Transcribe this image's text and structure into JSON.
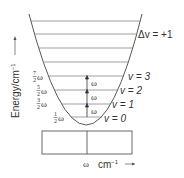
{
  "diagram": {
    "y_axis_label": "Energy/cm",
    "y_axis_exp": "−1",
    "selection_rule": "Δv = +1",
    "levels": [
      {
        "label": "v = 0",
        "energy_num": "1",
        "energy_den": "2",
        "energy_sym": "ω"
      },
      {
        "label": "v = 1",
        "energy_num": "3",
        "energy_den": "2",
        "energy_sym": "ω"
      },
      {
        "label": "v = 2",
        "energy_num": "5",
        "energy_den": "2",
        "energy_sym": "ω"
      },
      {
        "label": "v = 3",
        "energy_num": "7",
        "energy_den": "2",
        "energy_sym": "ω"
      }
    ],
    "transition_label": "ω",
    "spectrum_line_label": "ω",
    "x_axis_label": "cm",
    "x_axis_exp": "−1"
  }
}
